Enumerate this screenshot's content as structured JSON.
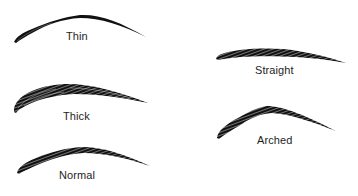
{
  "diagram": {
    "ink_color": "#111111",
    "background": "#ffffff",
    "shapes": [
      {
        "id": "thin",
        "label": "Thin"
      },
      {
        "id": "thick",
        "label": "Thick"
      },
      {
        "id": "normal",
        "label": "Normal"
      },
      {
        "id": "straight",
        "label": "Straight"
      },
      {
        "id": "arched",
        "label": "Arched"
      }
    ]
  }
}
